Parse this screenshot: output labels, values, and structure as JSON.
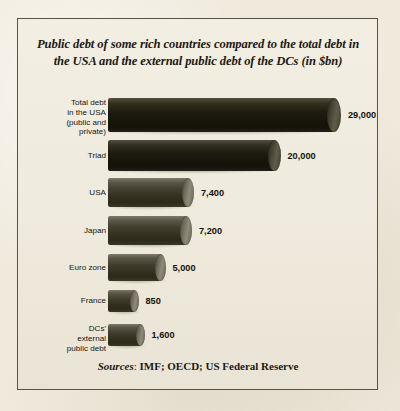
{
  "figure": {
    "title": "Public debt of some rich countries compared to the total debt in the USA and the external public debt of the DCs (in $bn)",
    "background_color": "#efeadc",
    "frame_color": "#595244",
    "bar_color": "#383427",
    "cap_color": "#8e8a7a"
  },
  "sources": {
    "lead": "Sources",
    "separator": ": ",
    "rest": "IMF; OECD; US Federal Reserve"
  },
  "chart_data": {
    "type": "bar",
    "orientation": "horizontal",
    "title": "Public debt of some rich countries compared to the total debt in the USA and the external public debt of the DCs (in $bn)",
    "xlabel": "",
    "ylabel": "",
    "unit": "$bn",
    "grid": false,
    "legend": null,
    "note": "Bar lengths in the original figure are not drawn proportional to the values; drawn pixel lengths are recorded separately in bar_px.",
    "categories": [
      "Total debt\nin the USA\n(public and\nprivate)",
      "Triad",
      "USA",
      "Japan",
      "Euro zone",
      "France",
      "DCs'\nexternal\npublic debt"
    ],
    "value_labels": [
      "29,000",
      "20,000",
      "7,400",
      "7,200",
      "5,000",
      "850",
      "1,600"
    ],
    "values": [
      29000,
      20000,
      7400,
      7200,
      5000,
      850,
      1600
    ],
    "bar_px": [
      226,
      166,
      80,
      78,
      52,
      26,
      32
    ],
    "bar_height_px": [
      34,
      31,
      29,
      29,
      27,
      22,
      22
    ],
    "row_top_px": [
      6,
      48,
      86,
      124,
      162,
      198,
      232
    ],
    "tones": [
      "dark",
      "dark",
      "mid",
      "mid",
      "mid",
      "mid",
      "mid"
    ]
  }
}
